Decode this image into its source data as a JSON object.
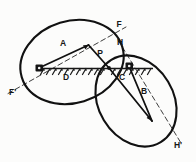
{
  "figure": {
    "background_color": "#fcfcfb",
    "ink_color": "#141414",
    "labels": {
      "F": "F",
      "F_prime": "F'",
      "H": "H",
      "H_prime": "H'",
      "P": "P",
      "A": "A",
      "B": "B",
      "C": "C",
      "D": "D"
    },
    "caption_partial": "",
    "elements": {
      "left_ellipse_name": "left-ellipse",
      "right_ellipse_name": "right-ellipse",
      "contact_point_name": "contact-point-p",
      "ground_line_name": "hatched-ground-line",
      "left_pivot_name": "left-pivot-bearing",
      "right_pivot_name": "right-pivot-bearing",
      "axis_ff_name": "dashed-axis-f-fprime",
      "axis_hh_name": "dashed-axis-h-hprime",
      "arrow_a_name": "radius-arrow-a",
      "arrow_b_name": "radius-arrow-b"
    }
  },
  "geometry": {
    "left_ellipse": {
      "cx": 72,
      "cy": 62,
      "rx": 52,
      "ry": 41,
      "rotation_deg": -17
    },
    "right_ellipse": {
      "cx": 135,
      "cy": 100,
      "rx": 48,
      "ry": 37,
      "rotation_deg": 62
    },
    "contact_point": {
      "x": 109,
      "y": 68
    },
    "left_pivot": {
      "x": 39,
      "y": 68
    },
    "right_pivot": {
      "x": 130,
      "y": 66
    },
    "axis_ff": {
      "x1": 10,
      "y1": 92,
      "x2": 124,
      "y2": 28
    },
    "axis_hh": {
      "x1": 120,
      "y1": 42,
      "x2": 180,
      "y2": 142
    },
    "ground_line": {
      "x1": 36,
      "y1": 68,
      "x2": 152,
      "y2": 68
    },
    "arrow_a": {
      "x1": 41,
      "y1": 68,
      "x2": 89,
      "y2": 45
    },
    "arrow_b": {
      "x1": 129,
      "y1": 66,
      "x2": 152,
      "y2": 122
    },
    "segment_p": {
      "x1": 89,
      "y1": 45,
      "x2": 109,
      "y2": 68
    },
    "segment_c": {
      "x1": 109,
      "y1": 68,
      "x2": 152,
      "y2": 122
    }
  }
}
